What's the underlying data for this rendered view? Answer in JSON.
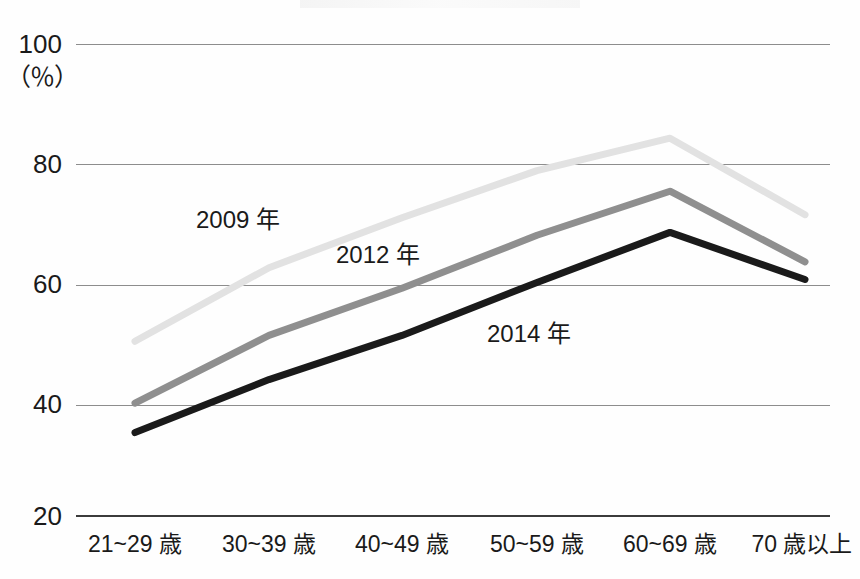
{
  "chart_data": {
    "type": "line",
    "title": "",
    "subtitle": "",
    "xlabel": "",
    "ylabel": "",
    "unit_label": "（％）",
    "categories": [
      "21~29 歳",
      "30~39 歳",
      "40~49 歳",
      "50~59 歳",
      "60~69 歳",
      "70 歳以上"
    ],
    "ylim": [
      20,
      100
    ],
    "yticks": [
      20,
      40,
      60,
      80,
      100
    ],
    "ytick_labels": [
      "20",
      "40",
      "60",
      "80",
      "100"
    ],
    "grid": true,
    "legend_position": "inline-annotations",
    "series": [
      {
        "name": "2009 年",
        "color": "#e2e2e2",
        "values": [
          49.5,
          62.0,
          70.5,
          78.5,
          84.0,
          71.0
        ]
      },
      {
        "name": "2012 年",
        "color": "#8f8f8f",
        "values": [
          39.0,
          50.5,
          58.5,
          67.5,
          75.0,
          63.0
        ]
      },
      {
        "name": "2014 年",
        "color": "#1a1a1a",
        "values": [
          34.0,
          43.0,
          50.5,
          59.5,
          68.0,
          60.0
        ]
      }
    ],
    "annotations": [
      {
        "text": "2009 年",
        "x_px": 196,
        "y_px": 207
      },
      {
        "text": "2012 年",
        "x_px": 336,
        "y_px": 242
      },
      {
        "text": "2014 年",
        "x_px": 487,
        "y_px": 321
      }
    ]
  }
}
